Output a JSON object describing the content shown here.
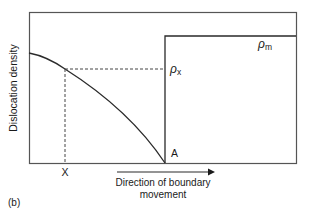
{
  "figure": {
    "panel_label": "(b)",
    "y_axis_label": "Dislocation density",
    "x_axis_label_line1": "Direction of boundary",
    "x_axis_label_line2": "movement",
    "point_x_label": "X",
    "point_a_label": "A",
    "rho_x_label": "ρ",
    "rho_x_sub": "x",
    "rho_m_label": "ρ",
    "rho_m_sub": "m"
  },
  "colors": {
    "line": "#2a2a2a",
    "frame": "#555555",
    "dashed": "#444444",
    "background": "#ffffff"
  }
}
